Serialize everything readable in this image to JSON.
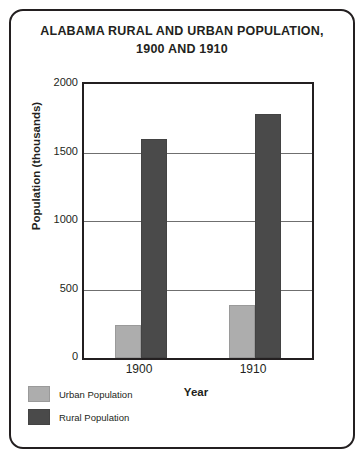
{
  "chart_data": {
    "type": "bar",
    "title": "ALABAMA RURAL AND URBAN POPULATION, 1900 AND 1910",
    "title_line1": "ALABAMA RURAL AND URBAN POPULATION,",
    "title_line2": "1900 AND 1910",
    "xlabel": "Year",
    "ylabel": "Population (thousands)",
    "categories": [
      "1900",
      "1910"
    ],
    "series": [
      {
        "name": "Urban Population",
        "values": [
          240,
          390
        ],
        "color": "#adadad"
      },
      {
        "name": "Rural Population",
        "values": [
          1600,
          1780
        ],
        "color": "#4a4a4a"
      }
    ],
    "ylim": [
      0,
      2000
    ],
    "yticks": [
      0,
      500,
      1000,
      1500,
      2000
    ],
    "ytick_labels": [
      "0",
      "500",
      "1000",
      "1500",
      "2000"
    ],
    "grid": true,
    "gridlines_at": [
      500,
      1000,
      1500
    ],
    "legend_position": "bottom-left"
  },
  "legend": {
    "items": [
      {
        "label": "Urban Population"
      },
      {
        "label": "Rural Population"
      }
    ]
  }
}
